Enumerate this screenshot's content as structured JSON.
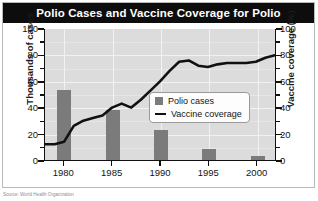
{
  "title": "Polio Cases and Vaccine Coverage for Polio",
  "caption": "Source: World Health Organization",
  "legend": {
    "items": [
      {
        "label": "Polio cases",
        "marker": "square-swatch",
        "color": "#7b7b7b"
      },
      {
        "label": "Vaccine coverage",
        "marker": "line-swatch",
        "color": "#111111"
      }
    ]
  },
  "axes": {
    "left": {
      "label": "Thousands of cases",
      "ticks": [
        "0",
        "20",
        "40",
        "60",
        "80",
        "100"
      ]
    },
    "right": {
      "label": "Vaccine coverage (%)",
      "ticks": [
        "0",
        "20",
        "40",
        "60",
        "80",
        "100"
      ]
    },
    "bottom": {
      "ticks": [
        "1980",
        "1985",
        "1990",
        "1995",
        "2000"
      ]
    }
  },
  "colors": {
    "title_bar": "#0d0d0d",
    "title_text": "#ffffff",
    "plot_background": "#dcdcdc",
    "gridline": "#f2f2f2",
    "bar": "#7b7b7b",
    "line": "#111111",
    "frame": "#b9b9b9"
  },
  "chart_data": {
    "type": "bar",
    "title": "Polio Cases and Vaccine Coverage for Polio",
    "xlabel": "",
    "ylabel": "Thousands of cases",
    "y2label": "Vaccine coverage (%)",
    "ylim": [
      0,
      100
    ],
    "y2lim": [
      0,
      100
    ],
    "xlim": [
      1978,
      2002
    ],
    "grid": true,
    "legend_position": "center-right-inside",
    "categories": [
      "1980",
      "1985",
      "1990",
      "1995",
      "2000"
    ],
    "series": [
      {
        "name": "Polio cases",
        "type": "bar",
        "axis": "left",
        "unit": "thousands of cases",
        "color": "#7b7b7b",
        "x": [
          1980,
          1985,
          1990,
          1995,
          2000
        ],
        "values": [
          53,
          38,
          23,
          8,
          3
        ]
      },
      {
        "name": "Vaccine coverage",
        "type": "line",
        "axis": "right",
        "unit": "percent",
        "color": "#111111",
        "x": [
          1978,
          1979,
          1980,
          1981,
          1982,
          1983,
          1984,
          1985,
          1986,
          1987,
          1988,
          1989,
          1990,
          1991,
          1992,
          1993,
          1994,
          1995,
          1996,
          1997,
          1998,
          1999,
          2000,
          2001,
          2002
        ],
        "values": [
          12,
          12,
          14,
          26,
          30,
          32,
          34,
          40,
          43,
          40,
          46,
          53,
          60,
          68,
          75,
          76,
          72,
          71,
          73,
          74,
          74,
          74,
          75,
          78,
          80
        ]
      }
    ]
  }
}
